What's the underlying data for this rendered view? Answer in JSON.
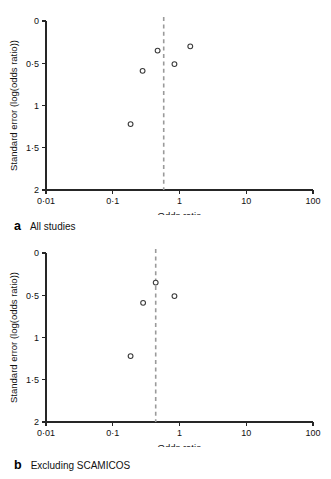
{
  "figure": {
    "panels": [
      {
        "id": "a",
        "caption_letter": "a",
        "caption_text": "All studies",
        "xlabel": "Odds ratio",
        "ylabel": "Standard error (log(odds ratio))"
      },
      {
        "id": "b",
        "caption_letter": "b",
        "caption_text": "Excluding SCAMICOS",
        "xlabel": "Odds ratio",
        "ylabel": "Standard error (log(odds ratio))"
      }
    ]
  },
  "chart_data": [
    {
      "type": "scatter",
      "title": "a  All studies",
      "xlabel": "Odds ratio",
      "ylabel": "Standard error (log(odds ratio))",
      "xscale": "log",
      "xlim": [
        0.01,
        100
      ],
      "ylim": [
        0,
        2
      ],
      "yinverted": true,
      "grid": false,
      "legend": null,
      "xticks": [
        0.01,
        0.1,
        1,
        10,
        100
      ],
      "xticklabels": [
        "0·01",
        "0·1",
        "1",
        "10",
        "100"
      ],
      "yticks": [
        0,
        0.5,
        1,
        1.5,
        2
      ],
      "yticklabels": [
        "0",
        "0·5",
        "1",
        "1·5",
        "2"
      ],
      "reference_line": {
        "orientation": "vertical",
        "value": 0.58,
        "style": "dashed",
        "color": "#9a9a9a"
      },
      "points": [
        {
          "x": 0.47,
          "y": 0.35
        },
        {
          "x": 1.45,
          "y": 0.3
        },
        {
          "x": 0.84,
          "y": 0.51
        },
        {
          "x": 0.28,
          "y": 0.59
        },
        {
          "x": 0.185,
          "y": 1.22
        }
      ]
    },
    {
      "type": "scatter",
      "title": "b  Excluding SCAMICOS",
      "xlabel": "Odds ratio",
      "ylabel": "Standard error (log(odds ratio))",
      "xscale": "log",
      "xlim": [
        0.01,
        100
      ],
      "ylim": [
        0,
        2
      ],
      "yinverted": true,
      "grid": false,
      "legend": null,
      "xticks": [
        0.01,
        0.1,
        1,
        10,
        100
      ],
      "xticklabels": [
        "0·01",
        "0·1",
        "1",
        "10",
        "100"
      ],
      "yticks": [
        0,
        0.5,
        1,
        1.5,
        2
      ],
      "yticklabels": [
        "0",
        "0·5",
        "1",
        "1·5",
        "2"
      ],
      "reference_line": {
        "orientation": "vertical",
        "value": 0.44,
        "style": "dashed",
        "color": "#9a9a9a"
      },
      "points": [
        {
          "x": 0.44,
          "y": 0.35
        },
        {
          "x": 0.84,
          "y": 0.51
        },
        {
          "x": 0.285,
          "y": 0.59
        },
        {
          "x": 0.185,
          "y": 1.22
        }
      ]
    }
  ],
  "colors": {
    "axis": "#262626",
    "marker_edge": "#3a3a3a",
    "marker_face": "#ffffff",
    "reference_line": "#9a9a9a",
    "background": "#ffffff"
  }
}
